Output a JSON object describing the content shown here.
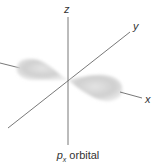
{
  "diagram": {
    "caption": {
      "symbol": "p",
      "subscript": "x",
      "text": " orbital"
    },
    "axes": [
      {
        "name": "x",
        "label": "x"
      },
      {
        "name": "y",
        "label": "y"
      },
      {
        "name": "z",
        "label": "z"
      }
    ],
    "colors": {
      "axis": "#555555",
      "lobe": "#c8c8c8",
      "background": "#ffffff"
    }
  }
}
